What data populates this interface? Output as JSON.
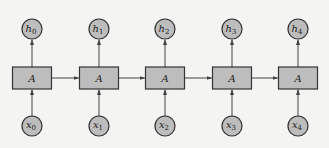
{
  "diagram": {
    "type": "unrolled-rnn",
    "cell_label": "A",
    "colors": {
      "background": "#f4f4f2",
      "node_fill": "#bdbdbd",
      "node_stroke": "#333333",
      "edge": "#444444"
    },
    "steps": [
      {
        "index": 0,
        "cell": "A",
        "input": {
          "base": "x",
          "sub": "0"
        },
        "output": {
          "base": "h",
          "sub": "0"
        },
        "cx": 32
      },
      {
        "index": 1,
        "cell": "A",
        "input": {
          "base": "x",
          "sub": "1"
        },
        "output": {
          "base": "h",
          "sub": "1"
        },
        "cx": 99
      },
      {
        "index": 2,
        "cell": "A",
        "input": {
          "base": "x",
          "sub": "2"
        },
        "output": {
          "base": "h",
          "sub": "2"
        },
        "cx": 165
      },
      {
        "index": 3,
        "cell": "A",
        "input": {
          "base": "x",
          "sub": "3"
        },
        "output": {
          "base": "h",
          "sub": "3"
        },
        "cx": 232
      },
      {
        "index": 4,
        "cell": "A",
        "input": {
          "base": "x",
          "sub": "4"
        },
        "output": {
          "base": "h",
          "sub": "4"
        },
        "cx": 298
      }
    ],
    "edges": [
      {
        "from": "x0",
        "to": "A0"
      },
      {
        "from": "A0",
        "to": "h0"
      },
      {
        "from": "x1",
        "to": "A1"
      },
      {
        "from": "A1",
        "to": "h1"
      },
      {
        "from": "x2",
        "to": "A2"
      },
      {
        "from": "A2",
        "to": "h2"
      },
      {
        "from": "x3",
        "to": "A3"
      },
      {
        "from": "A3",
        "to": "h3"
      },
      {
        "from": "x4",
        "to": "A4"
      },
      {
        "from": "A4",
        "to": "h4"
      },
      {
        "from": "A0",
        "to": "A1"
      },
      {
        "from": "A1",
        "to": "A2"
      },
      {
        "from": "A2",
        "to": "A3"
      },
      {
        "from": "A3",
        "to": "A4"
      }
    ]
  }
}
